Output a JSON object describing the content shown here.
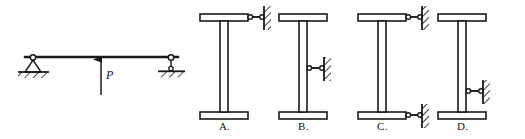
{
  "figure": {
    "kind": "structural-mechanics-multiple-choice",
    "stroke_color": "#1a1a1a",
    "hatch_color": "#1a1a1a",
    "background": "#ffffff"
  },
  "left_diagram": {
    "name": "simply-supported-beam-with-upward-point-load",
    "beam": {
      "x1": 25,
      "x2": 178,
      "y": 57
    },
    "load": {
      "label": "P",
      "label_x": 106,
      "label_y": 76,
      "direction": "up",
      "arrow_x": 101,
      "arrow_tip_y": 58,
      "arrow_tail_y": 95
    },
    "supports": [
      {
        "type": "pin",
        "name": "pin-support",
        "x": 33,
        "y": 58,
        "ground_y": 72,
        "ground_w": 32
      },
      {
        "type": "roller",
        "name": "roller-support",
        "x": 171,
        "y": 58,
        "ground_y": 74,
        "ground_w": 28
      }
    ]
  },
  "options": [
    {
      "id": "A",
      "label": "A.",
      "name": "option-a",
      "frame_cx": 224,
      "top_flange": {
        "x": 200,
        "y": 14,
        "w": 48,
        "h": 7
      },
      "bottom_flange": {
        "x": 200,
        "y": 112,
        "w": 48,
        "h": 7
      },
      "web": {
        "x": 220,
        "y": 21,
        "w": 8,
        "h": 91
      },
      "links": [
        {
          "name": "link-top-right",
          "y": 17,
          "x_start": 248,
          "x_end": 262,
          "wall_x": 264,
          "wall_y": 6,
          "wall_h": 24,
          "orientation": "horizontal"
        }
      ],
      "label_x": 219,
      "label_y": 124
    },
    {
      "id": "B",
      "label": "B.",
      "name": "option-b",
      "frame_cx": 303,
      "top_flange": {
        "x": 279,
        "y": 14,
        "w": 48,
        "h": 7
      },
      "bottom_flange": {
        "x": 279,
        "y": 112,
        "w": 48,
        "h": 7
      },
      "web": {
        "x": 299,
        "y": 21,
        "w": 8,
        "h": 91
      },
      "links": [
        {
          "name": "link-mid-right",
          "y": 68,
          "x_start": 307,
          "x_end": 322,
          "wall_x": 324,
          "wall_y": 57,
          "wall_h": 24,
          "orientation": "horizontal"
        }
      ],
      "label_x": 298,
      "label_y": 124
    },
    {
      "id": "C",
      "label": "C.",
      "name": "option-c",
      "frame_cx": 382,
      "top_flange": {
        "x": 358,
        "y": 14,
        "w": 48,
        "h": 7
      },
      "bottom_flange": {
        "x": 358,
        "y": 112,
        "w": 48,
        "h": 7
      },
      "web": {
        "x": 378,
        "y": 21,
        "w": 8,
        "h": 91
      },
      "links": [
        {
          "name": "link-top-right",
          "y": 17,
          "x_start": 406,
          "x_end": 420,
          "wall_x": 422,
          "wall_y": 6,
          "wall_h": 24,
          "orientation": "horizontal"
        },
        {
          "name": "link-bottom-right",
          "y": 115,
          "x_start": 406,
          "x_end": 420,
          "wall_x": 422,
          "wall_y": 104,
          "wall_h": 24,
          "orientation": "horizontal"
        }
      ],
      "label_x": 377,
      "label_y": 124
    },
    {
      "id": "D",
      "label": "D.",
      "name": "option-d",
      "frame_cx": 462,
      "top_flange": {
        "x": 438,
        "y": 14,
        "w": 48,
        "h": 7
      },
      "bottom_flange": {
        "x": 438,
        "y": 112,
        "w": 48,
        "h": 7
      },
      "web": {
        "x": 458,
        "y": 21,
        "w": 8,
        "h": 91
      },
      "links": [
        {
          "name": "link-lower-right",
          "y": 91,
          "x_start": 466,
          "x_end": 481,
          "wall_x": 483,
          "wall_y": 80,
          "wall_h": 24,
          "orientation": "horizontal"
        }
      ],
      "label_x": 457,
      "label_y": 124
    }
  ]
}
